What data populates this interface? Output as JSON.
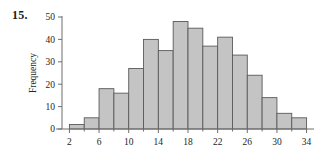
{
  "figure": {
    "problem_number": "15.",
    "background_color": "#ffffff"
  },
  "chart_data": {
    "type": "bar",
    "title": "",
    "subtitle": "",
    "xlabel": "",
    "ylabel": "Frequency",
    "bar_fill_color": "#c4c4c4",
    "bar_edge_color": "#5a5a5a",
    "axis_color": "#6e6e6e",
    "grid": false,
    "legend": null,
    "bin_width": 2,
    "xlim": [
      1,
      35
    ],
    "ylim": [
      0,
      50
    ],
    "x_tick_labels": [
      "2",
      "6",
      "10",
      "14",
      "18",
      "22",
      "26",
      "30",
      "34"
    ],
    "x_tick_values": [
      2,
      6,
      10,
      14,
      18,
      22,
      26,
      30,
      34
    ],
    "x_minor_tick_values": [
      4,
      8,
      12,
      16,
      20,
      24,
      28,
      32
    ],
    "y_tick_labels": [
      "0",
      "10",
      "20",
      "30",
      "40",
      "50"
    ],
    "y_tick_values": [
      0,
      10,
      20,
      30,
      40,
      50
    ],
    "bin_edges": [
      2,
      4,
      6,
      8,
      10,
      12,
      14,
      16,
      18,
      20,
      22,
      24,
      26,
      28,
      30,
      32,
      34
    ],
    "categories": [
      "2-4",
      "4-6",
      "6-8",
      "8-10",
      "10-12",
      "12-14",
      "14-16",
      "16-18",
      "18-20",
      "20-22",
      "22-24",
      "24-26",
      "26-28",
      "28-30",
      "30-32",
      "32-34"
    ],
    "values": [
      2,
      5,
      18,
      16,
      27,
      40,
      35,
      48,
      45,
      37,
      41,
      33,
      24,
      14,
      7,
      5
    ]
  }
}
